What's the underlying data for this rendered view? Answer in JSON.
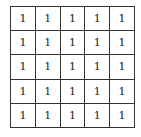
{
  "grid": {
    "rows": [
      [
        "1",
        "1",
        "1",
        "1",
        "1"
      ],
      [
        "1",
        "1",
        "1",
        "1",
        "1"
      ],
      [
        "1",
        "1",
        "1",
        "1",
        "1"
      ],
      [
        "1",
        "1",
        "1",
        "1",
        "1"
      ],
      [
        "1",
        "1",
        "1",
        "1",
        "1"
      ]
    ]
  }
}
